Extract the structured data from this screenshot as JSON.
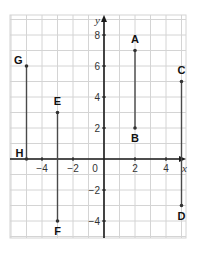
{
  "chart_data": {
    "type": "scatter",
    "title": "",
    "xlabel": "x",
    "ylabel": "y",
    "xlim": [
      -5.6,
      5.7
    ],
    "ylim": [
      -5.1,
      8.9
    ],
    "grid": true,
    "x_ticks": [
      -4,
      -2,
      0,
      2,
      4
    ],
    "y_ticks": [
      -4,
      -2,
      2,
      4,
      6,
      8
    ],
    "points": [
      {
        "label": "A",
        "x": 2,
        "y": 7
      },
      {
        "label": "B",
        "x": 2,
        "y": 2
      },
      {
        "label": "C",
        "x": 5,
        "y": 5
      },
      {
        "label": "D",
        "x": 5,
        "y": -3
      },
      {
        "label": "E",
        "x": -3,
        "y": 3
      },
      {
        "label": "F",
        "x": -3,
        "y": -4
      },
      {
        "label": "G",
        "x": -5,
        "y": 6
      },
      {
        "label": "H",
        "x": -5,
        "y": 0
      }
    ],
    "segments": [
      {
        "from": "A",
        "to": "B"
      },
      {
        "from": "C",
        "to": "D"
      },
      {
        "from": "E",
        "to": "F"
      },
      {
        "from": "G",
        "to": "H"
      }
    ]
  },
  "labels": {
    "x_axis": "x",
    "y_axis": "y",
    "x_ticks": [
      "−4",
      "−2",
      "0",
      "2",
      "4"
    ],
    "y_ticks": [
      "−4",
      "−2",
      "2",
      "4",
      "6",
      "8"
    ],
    "points": [
      "A",
      "B",
      "C",
      "D",
      "E",
      "F",
      "G",
      "H"
    ]
  },
  "colors": {
    "grid": "#d4d4d4",
    "axis": "#1a1a1a",
    "segment": "#4a4a4a"
  }
}
